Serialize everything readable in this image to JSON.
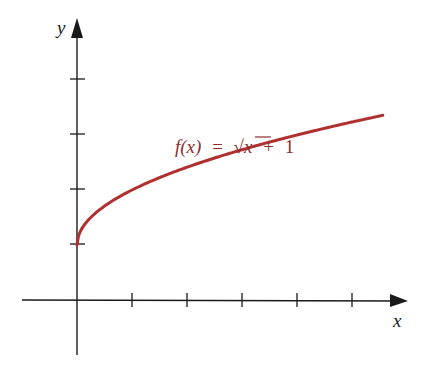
{
  "chart_data": {
    "type": "line",
    "title": "",
    "function": "f(x) = √x + 1",
    "xlabel": "x",
    "ylabel": "y",
    "x_ticks": [
      1,
      2,
      3,
      4,
      5
    ],
    "y_ticks": [
      1,
      2,
      3,
      4
    ],
    "xlim": [
      -1,
      6
    ],
    "ylim": [
      -1,
      4.2
    ],
    "grid": false,
    "series": [
      {
        "name": "f(x) = √x + 1",
        "color": "#b03030",
        "x": [
          0,
          0.25,
          0.5,
          1,
          1.5,
          2,
          2.5,
          3,
          3.5,
          4,
          4.5,
          5,
          5.56
        ],
        "y": [
          1,
          1.5,
          1.71,
          2,
          2.22,
          2.41,
          2.58,
          2.73,
          2.87,
          3,
          3.12,
          3.24,
          3.36
        ]
      }
    ]
  },
  "labels": {
    "x_axis": "x",
    "y_axis": "y",
    "f_name": "f",
    "f_arg": "(x)",
    "equals": "=",
    "sqrt": "√",
    "var": "x",
    "plus": "+",
    "one": "1"
  },
  "colors": {
    "axis": "#1a1a1a",
    "curve": "#b03030",
    "label": "#8b2e2e"
  }
}
